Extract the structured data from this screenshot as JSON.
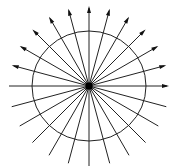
{
  "diagram": {
    "type": "radial-field-lines",
    "center": {
      "x": 89,
      "y": 86
    },
    "center_node": {
      "size": 7,
      "color": "#000000"
    },
    "circle": {
      "rx": 57,
      "ry": 55,
      "stroke": "#222222",
      "stroke_width": 1
    },
    "rays": {
      "count": 24,
      "step_deg": 15,
      "length": 80,
      "stroke": "#222222",
      "stroke_width": 1,
      "arrowed_angles_deg": [
        0,
        15,
        30,
        45,
        60,
        75,
        90,
        105,
        120,
        135,
        150,
        165
      ],
      "plain_angles_deg": [
        180,
        195,
        210,
        225,
        240,
        255,
        270,
        285,
        300,
        315,
        330,
        345
      ]
    },
    "arrowhead": {
      "length": 7,
      "width": 4,
      "color": "#111111"
    }
  }
}
